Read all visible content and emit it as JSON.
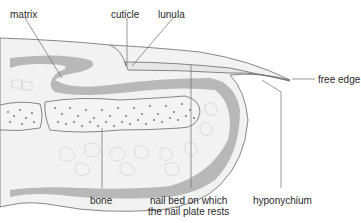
{
  "diagram": {
    "labels": {
      "matrix": "matrix",
      "cuticle": "cuticle",
      "lunula": "lunula",
      "free_edge": "free edge",
      "bone": "bone",
      "nail_bed_line1": "nail bed on which",
      "nail_bed_line2": "the nail plate rests",
      "hyponychium": "hyponychium"
    },
    "colors": {
      "background": "#ffffff",
      "outline": "#6a6a6a",
      "tissue_grey": "#b4b4b4",
      "pale_fill": "#ececec",
      "bone_fill": "#f4f4f4",
      "bone_dots": "#7a7a7a",
      "text": "#2a2a2a"
    }
  }
}
